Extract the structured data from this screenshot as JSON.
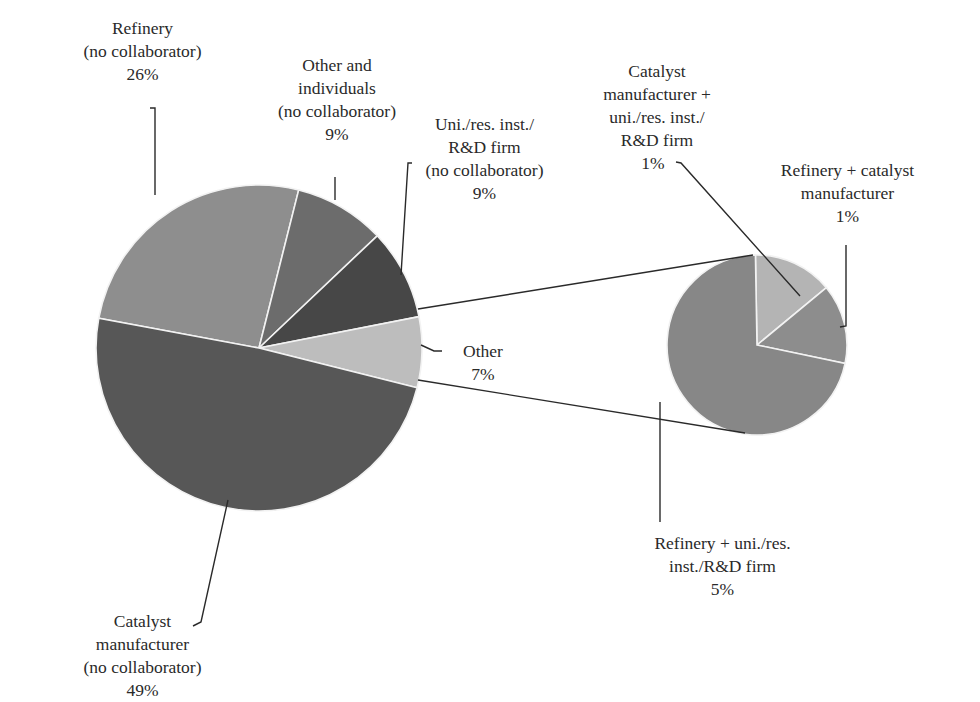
{
  "chart_data": {
    "type": "pie",
    "title": "",
    "subtype": "pie-of-pie",
    "main_pie": {
      "slices": [
        {
          "label": "Refinery (no collaborator)",
          "value": 26,
          "color": "#8e8e8e"
        },
        {
          "label": "Other and individuals (no collaborator)",
          "value": 9,
          "color": "#6c6c6c"
        },
        {
          "label": "Uni./res. inst./R&D firm (no collaborator)",
          "value": 9,
          "color": "#474747"
        },
        {
          "label": "Other",
          "value": 7,
          "color": "#bdbdbd"
        },
        {
          "label": "Catalyst manufacturer (no collaborator)",
          "value": 49,
          "color": "#575757"
        }
      ]
    },
    "secondary_pie": {
      "expands": "Other",
      "slices": [
        {
          "label": "Catalyst manufacturer + uni./res. inst./R&D firm",
          "value": 1,
          "color": "#b4b4b4"
        },
        {
          "label": "Refinery + catalyst manufacturer",
          "value": 1,
          "color": "#8d8d8d"
        },
        {
          "label": "Refinery + uni./res. inst./R&D firm",
          "value": 5,
          "color": "#878787"
        }
      ]
    }
  },
  "labels": {
    "refinery": {
      "lines": [
        "Refinery",
        "(no collaborator)"
      ],
      "pct": "26%"
    },
    "other_individuals": {
      "lines": [
        "Other and",
        "individuals",
        "(no collaborator)"
      ],
      "pct": "9%"
    },
    "uni": {
      "lines": [
        "Uni./res. inst./",
        "R&D firm",
        "(no collaborator)"
      ],
      "pct": "9%"
    },
    "other": {
      "lines": [
        "Other"
      ],
      "pct": "7%"
    },
    "catalyst": {
      "lines": [
        "Catalyst",
        "manufacturer",
        "(no collaborator)"
      ],
      "pct": "49%"
    },
    "cat_uni": {
      "lines": [
        "Catalyst",
        "manufacturer +",
        "uni./res. inst./",
        "R&D firm"
      ],
      "pct": "1%"
    },
    "ref_cat": {
      "lines": [
        "Refinery + catalyst",
        "manufacturer"
      ],
      "pct": "1%"
    },
    "ref_uni": {
      "lines": [
        "Refinery + uni./res.",
        "inst./R&D firm"
      ],
      "pct": "5%"
    }
  }
}
